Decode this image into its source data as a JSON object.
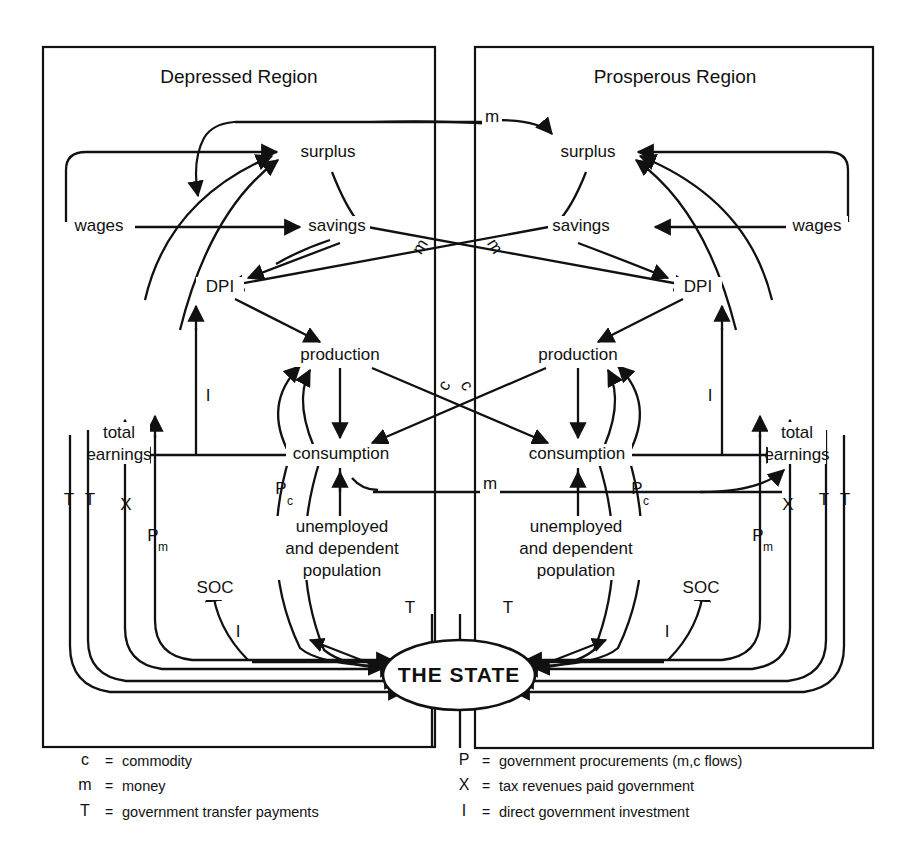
{
  "figure": {
    "type": "flow-diagram",
    "regions": [
      {
        "id": "left",
        "title": "Depressed Region"
      },
      {
        "id": "right",
        "title": "Prosperous Region"
      }
    ],
    "center_node": "THE STATE"
  },
  "nodes": {
    "left": {
      "surplus": "surplus",
      "wages": "wages",
      "savings": "savings",
      "dpi": "DPI",
      "production": "production",
      "consumption": "consumption",
      "total_earnings_1": "total",
      "total_earnings_2": "earnings",
      "unemployed_1": "unemployed",
      "unemployed_2": "and dependent",
      "unemployed_3": "population",
      "soc": "SOC"
    },
    "right": {
      "surplus": "surplus",
      "wages": "wages",
      "savings": "savings",
      "dpi": "DPI",
      "production": "production",
      "consumption": "consumption",
      "total_earnings_1": "total",
      "total_earnings_2": "earnings",
      "unemployed_1": "unemployed",
      "unemployed_2": "and dependent",
      "unemployed_3": "population",
      "soc": "SOC"
    },
    "state": "THE STATE"
  },
  "flow_labels": {
    "m_top": "m",
    "m_cross_left": "m",
    "m_cross_right": "m",
    "m_consumption": "m",
    "c_left": "c",
    "c_right": "c",
    "i_left": "I",
    "i_right": "I",
    "i_soc_left": "I",
    "i_soc_right": "I",
    "t_left_outer": "T",
    "t_left_inner": "T",
    "x_left": "X",
    "p_left": "P",
    "p_left_sub": "m",
    "pc_left": "P",
    "pc_left_sub": "c",
    "t_unemployed_left": "T",
    "t_right_outer": "T",
    "t_right_inner": "T",
    "x_right": "X",
    "p_right": "P",
    "p_right_sub": "m",
    "pc_right": "P",
    "pc_right_sub": "c",
    "t_unemployed_right": "T"
  },
  "legend": {
    "left_column": [
      {
        "key": "c",
        "eq": "=",
        "text": "commodity"
      },
      {
        "key": "m",
        "eq": "=",
        "text": "money"
      },
      {
        "key": "T",
        "eq": "=",
        "text": "government transfer payments"
      }
    ],
    "right_column": [
      {
        "key": "P",
        "eq": "=",
        "text": "government procurements (m,c flows)"
      },
      {
        "key": "X",
        "eq": "=",
        "text": "tax revenues paid government"
      },
      {
        "key": "I",
        "eq": "=",
        "text": "direct government investment"
      }
    ]
  },
  "colors": {
    "ink": "#111111",
    "paper": "#ffffff"
  }
}
